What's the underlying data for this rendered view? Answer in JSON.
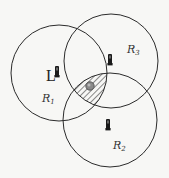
{
  "diagram": {
    "type": "trilateration",
    "colors": {
      "stroke": "#2b2b2b",
      "background": "#f7f7f5",
      "hatch": "#2b2b2b",
      "target": "#8a8a8a",
      "phone": "#1a1a1a"
    },
    "regions": [
      {
        "id": "R1",
        "label": "R",
        "subscript": "1",
        "cx": 59,
        "cy": 73,
        "r": 48,
        "label_x": 42,
        "label_y": 102,
        "device_x": 57,
        "device_y": 72
      },
      {
        "id": "R2",
        "label": "R",
        "subscript": "2",
        "cx": 110,
        "cy": 120,
        "r": 47,
        "label_x": 113,
        "label_y": 149,
        "device_x": 108,
        "device_y": 125
      },
      {
        "id": "R3",
        "label": "R",
        "subscript": "3",
        "cx": 111,
        "cy": 61,
        "r": 47,
        "label_x": 127,
        "label_y": 53,
        "device_x": 110,
        "device_y": 60
      }
    ],
    "annotation": {
      "text": "L",
      "x": 46,
      "y": 81
    },
    "target": {
      "x": 90,
      "y": 86,
      "r": 4
    },
    "intersection": "hatched"
  }
}
